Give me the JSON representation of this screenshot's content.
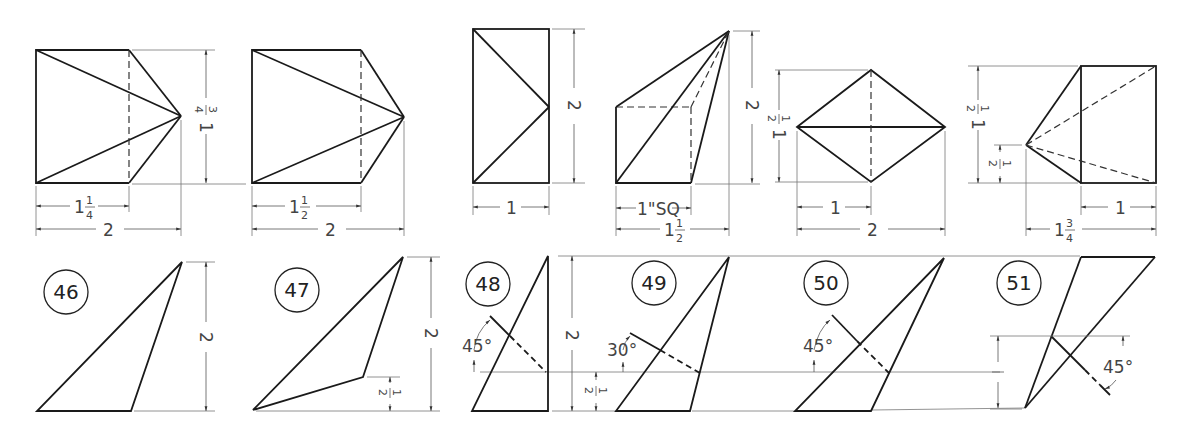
{
  "figure": {
    "problems": [
      {
        "number": "46",
        "top_dims": {
          "inner": "1 1/4",
          "overall": "2",
          "height": "1 3/4"
        },
        "bottom_dims": {
          "height": "2"
        }
      },
      {
        "number": "47",
        "top_dims": {
          "inner": "1 1/2",
          "overall": "2"
        },
        "bottom_dims": {
          "height": "2",
          "offset": "1/2"
        }
      },
      {
        "number": "48",
        "top_dims": {
          "width": "1",
          "height": "2"
        },
        "bottom_dims": {
          "angle": "45°",
          "height": "2",
          "offset": "1/2"
        }
      },
      {
        "number": "49",
        "top_dims": {
          "square": "1\"SQ",
          "overall": "1 1/2",
          "height": "2"
        },
        "bottom_dims": {
          "angle": "30°"
        }
      },
      {
        "number": "50",
        "top_dims": {
          "half_height": "1 1/2",
          "inner": "1",
          "overall": "2"
        },
        "bottom_dims": {
          "angle": "45°"
        }
      },
      {
        "number": "51",
        "top_dims": {
          "height": "1 1/2",
          "lower": "1/2",
          "width": "1",
          "overall": "1 3/4"
        },
        "bottom_dims": {
          "height": "1",
          "angle": "45°"
        }
      }
    ]
  },
  "labels": {
    "n46": "46",
    "n47": "47",
    "n48": "48",
    "n49": "49",
    "n50": "50",
    "n51": "51",
    "one": "1",
    "two": "2",
    "sq": "1\"SQ",
    "frac_1": "1",
    "frac_2": "2",
    "frac_3": "3",
    "frac_4": "4",
    "deg45": "45°",
    "deg30": "30°"
  }
}
